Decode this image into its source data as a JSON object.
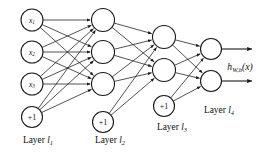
{
  "figure": {
    "background_color": "#ffffff",
    "stroke_color": "#1a1a1a",
    "width": 280,
    "height": 161
  },
  "output_label": {
    "base": "h",
    "subscript": "W,b",
    "argument": "(x)",
    "full": "h_{W,b}(x)"
  },
  "layers": [
    {
      "id": "layer-1",
      "name": "Layer l1",
      "label_prefix": "Layer ",
      "label_symbol": "l",
      "label_subscript": "1",
      "label_x": 38,
      "label_y": 143,
      "x": 32,
      "radius": 11,
      "units": [
        {
          "id": "x1",
          "label": "x",
          "subscript": "1",
          "cy": 20,
          "type": "input"
        },
        {
          "id": "x2",
          "label": "x",
          "subscript": "2",
          "cy": 52,
          "type": "input"
        },
        {
          "id": "x3",
          "label": "x",
          "subscript": "3",
          "cy": 84,
          "type": "input"
        }
      ],
      "bias": {
        "id": "bias-1",
        "label": "+1",
        "cy": 117,
        "radius": 10.5
      }
    },
    {
      "id": "layer-2",
      "name": "Layer l2",
      "label_prefix": "Layer ",
      "label_symbol": "l",
      "label_subscript": "2",
      "label_x": 110,
      "label_y": 143,
      "x": 103,
      "radius": 11.5,
      "units": [
        {
          "id": "a21",
          "label": "",
          "subscript": "",
          "cy": 20,
          "type": "hidden"
        },
        {
          "id": "a22",
          "label": "",
          "subscript": "",
          "cy": 52,
          "type": "hidden"
        },
        {
          "id": "a23",
          "label": "",
          "subscript": "",
          "cy": 84,
          "type": "hidden"
        }
      ],
      "bias": {
        "id": "bias-2",
        "label": "+1",
        "cy": 122,
        "radius": 10.5
      }
    },
    {
      "id": "layer-3",
      "name": "Layer l3",
      "label_prefix": "Layer ",
      "label_symbol": "l",
      "label_subscript": "3",
      "label_x": 172,
      "label_y": 130,
      "x": 164,
      "radius": 11.5,
      "units": [
        {
          "id": "a31",
          "label": "",
          "subscript": "",
          "cy": 37,
          "type": "hidden"
        },
        {
          "id": "a32",
          "label": "",
          "subscript": "",
          "cy": 70,
          "type": "hidden"
        }
      ],
      "bias": {
        "id": "bias-3",
        "label": "+1",
        "cy": 106,
        "radius": 10.5
      }
    },
    {
      "id": "layer-4",
      "name": "Layer l4",
      "label_prefix": "Layer ",
      "label_symbol": "l",
      "label_subscript": "4",
      "label_x": 219,
      "label_y": 113,
      "x": 211,
      "radius": 10.5,
      "units": [
        {
          "id": "o1",
          "label": "",
          "subscript": "",
          "cy": 49,
          "type": "output"
        },
        {
          "id": "o2",
          "label": "",
          "subscript": "",
          "cy": 81,
          "type": "output"
        }
      ],
      "bias": null
    }
  ],
  "output_arrows": [
    {
      "id": "out-arrow-1",
      "y": 49,
      "x_start": 222,
      "x_end": 252
    },
    {
      "id": "out-arrow-2",
      "y": 81,
      "x_start": 222,
      "x_end": 252
    }
  ],
  "output_label_pos": {
    "x": 240,
    "y": 70
  }
}
